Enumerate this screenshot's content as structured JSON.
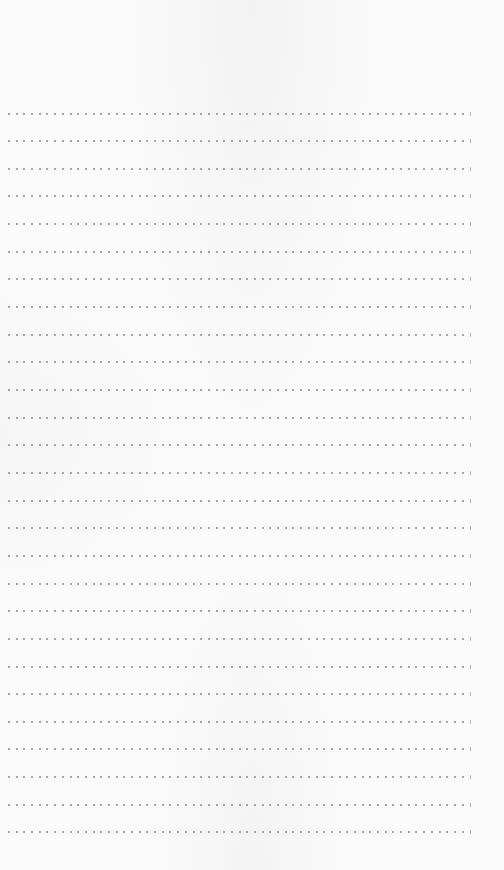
{
  "document": {
    "type": "lined-writing-page",
    "line_style": "dotted",
    "line_count": 27,
    "dots_per_line": 60,
    "colors": {
      "paper": "#fbfbfb",
      "dot": "#8a8a8a",
      "line_end_tick": "#b5b5b5"
    }
  }
}
